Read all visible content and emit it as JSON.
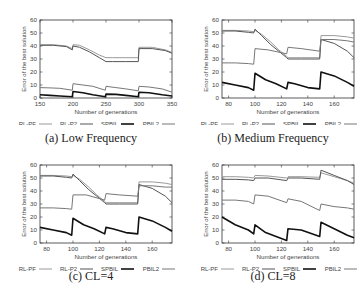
{
  "chart_data": [
    {
      "id": "a",
      "type": "line",
      "caption": "(a) Low Frequency",
      "xlabel": "Number of generations",
      "ylabel": "Error of the best solution",
      "xlim": [
        150,
        350
      ],
      "ylim": [
        0,
        60
      ],
      "xticks": [
        150,
        200,
        250,
        300,
        350
      ],
      "yticks": [
        0,
        10,
        20,
        30,
        40,
        50,
        60
      ],
      "grid": false,
      "legend_position": "bottom",
      "series": [
        {
          "name": "RL-PF",
          "color": "#9a9a9a",
          "width": 1,
          "x": [
            150,
            170,
            190,
            199,
            200,
            210,
            225,
            240,
            250,
            260,
            280,
            299,
            300,
            320,
            340,
            350
          ],
          "y": [
            41,
            41,
            40,
            38,
            41,
            40.5,
            37,
            33,
            31,
            31,
            31,
            31,
            39,
            39,
            37,
            35
          ]
        },
        {
          "name": "RL-P2",
          "color": "#555555",
          "width": 1,
          "x": [
            150,
            170,
            190,
            199,
            200,
            210,
            225,
            240,
            250,
            260,
            280,
            299,
            300,
            320,
            340,
            350
          ],
          "y": [
            40.5,
            40.5,
            39.5,
            37,
            40,
            39,
            35.5,
            31,
            28,
            28,
            28,
            28,
            38,
            38,
            36.5,
            34.5
          ]
        },
        {
          "name": "SPBIL",
          "color": "#111111",
          "width": 1.6,
          "x": [
            150,
            165,
            180,
            199,
            200,
            215,
            230,
            249,
            250,
            265,
            280,
            299,
            300,
            315,
            335,
            350
          ],
          "y": [
            2.5,
            2,
            1.5,
            1,
            5,
            4,
            2.5,
            1,
            3,
            2.8,
            2,
            1,
            4.5,
            4,
            2.5,
            1.5
          ]
        },
        {
          "name": "PBIL2",
          "color": "#777777",
          "width": 1,
          "x": [
            150,
            165,
            180,
            199,
            200,
            215,
            230,
            249,
            250,
            265,
            280,
            299,
            300,
            315,
            335,
            350
          ],
          "y": [
            8,
            7.8,
            7.5,
            6,
            11,
            10,
            9,
            6,
            9,
            8,
            7,
            5.5,
            9,
            8.5,
            7,
            4.5
          ]
        }
      ]
    },
    {
      "id": "b",
      "type": "line",
      "caption": "(b) Medium Frequency",
      "xlabel": "Number of generations",
      "ylabel": "Error of the best solution",
      "xlim": [
        75,
        175
      ],
      "ylim": [
        0,
        60
      ],
      "xticks": [
        80,
        100,
        120,
        140,
        160
      ],
      "yticks": [
        0,
        10,
        20,
        30,
        40,
        50,
        60
      ],
      "grid": false,
      "legend_position": "bottom",
      "series": [
        {
          "name": "RL-PF",
          "color": "#9a9a9a",
          "width": 1,
          "x": [
            75,
            85,
            95,
            99,
            100,
            105,
            112,
            118,
            124,
            125,
            135,
            149,
            150,
            160,
            170,
            175
          ],
          "y": [
            52,
            52,
            51.5,
            51,
            52,
            49,
            43,
            37,
            32,
            31,
            31,
            31,
            48,
            48,
            47,
            46
          ]
        },
        {
          "name": "RL-P2",
          "color": "#555555",
          "width": 1,
          "x": [
            75,
            85,
            95,
            99,
            100,
            105,
            112,
            118,
            124,
            125,
            135,
            149,
            150,
            160,
            170,
            175
          ],
          "y": [
            51.5,
            51.5,
            50.5,
            50,
            53,
            48,
            41,
            36,
            31,
            30,
            30,
            30,
            45,
            42,
            36,
            31
          ]
        },
        {
          "name": "SPBIL",
          "color": "#111111",
          "width": 1.6,
          "x": [
            75,
            85,
            95,
            99,
            100,
            108,
            116,
            124,
            125,
            130,
            140,
            149,
            150,
            160,
            170,
            175
          ],
          "y": [
            12,
            10,
            8,
            6,
            19,
            14,
            11,
            7,
            12,
            11,
            8,
            7,
            20,
            17,
            12,
            9
          ]
        },
        {
          "name": "PBIL2",
          "color": "#777777",
          "width": 1,
          "x": [
            75,
            85,
            95,
            99,
            100,
            110,
            124,
            125,
            135,
            149,
            150,
            160,
            170,
            175
          ],
          "y": [
            27,
            27,
            26.5,
            26,
            38,
            37,
            34,
            39,
            38,
            36,
            45,
            45,
            44,
            43
          ]
        }
      ]
    },
    {
      "id": "c",
      "type": "line",
      "caption": "(c) CL=4",
      "xlabel": "Number of generations",
      "ylabel": "Error of the best solution",
      "xlim": [
        75,
        175
      ],
      "ylim": [
        0,
        60
      ],
      "xticks": [
        80,
        100,
        120,
        140,
        160
      ],
      "yticks": [
        0,
        10,
        20,
        30,
        40,
        50,
        60
      ],
      "grid": false,
      "legend_position": "bottom",
      "series": [
        {
          "name": "RL-PF",
          "color": "#9a9a9a",
          "width": 1,
          "x": [
            75,
            85,
            95,
            99,
            100,
            105,
            112,
            118,
            124,
            125,
            135,
            149,
            150,
            160,
            170,
            175
          ],
          "y": [
            52,
            52,
            51.5,
            51,
            52,
            49,
            43,
            37,
            32,
            31,
            31,
            31,
            47,
            47,
            46,
            45
          ]
        },
        {
          "name": "RL-P2",
          "color": "#555555",
          "width": 1,
          "x": [
            75,
            85,
            95,
            99,
            100,
            105,
            112,
            118,
            124,
            125,
            135,
            149,
            150,
            160,
            170,
            175
          ],
          "y": [
            51.5,
            51.5,
            50.5,
            50,
            53,
            48,
            41,
            36,
            31,
            30,
            30,
            30,
            45,
            42,
            36,
            31
          ]
        },
        {
          "name": "SPBIL",
          "color": "#111111",
          "width": 1.6,
          "x": [
            75,
            85,
            95,
            99,
            100,
            108,
            116,
            124,
            125,
            130,
            140,
            149,
            150,
            160,
            170,
            175
          ],
          "y": [
            12,
            10,
            8,
            6,
            19,
            14,
            11,
            7,
            12,
            11,
            8,
            7,
            20,
            17,
            12,
            9
          ]
        },
        {
          "name": "PBIL2",
          "color": "#777777",
          "width": 1,
          "x": [
            75,
            85,
            95,
            99,
            100,
            110,
            124,
            125,
            135,
            149,
            150,
            160,
            170,
            175
          ],
          "y": [
            27,
            27,
            26.5,
            26,
            37,
            37,
            33,
            38,
            37,
            36,
            44,
            44,
            43,
            43
          ]
        }
      ]
    },
    {
      "id": "d",
      "type": "line",
      "caption": "(d) CL=8",
      "xlabel": "Number of generations",
      "ylabel": "Error of the best solution",
      "xlim": [
        75,
        175
      ],
      "ylim": [
        0,
        60
      ],
      "xticks": [
        80,
        100,
        120,
        140,
        160
      ],
      "yticks": [
        0,
        10,
        20,
        30,
        40,
        50,
        60
      ],
      "grid": false,
      "legend_position": "bottom",
      "series": [
        {
          "name": "RL-PF",
          "color": "#9a9a9a",
          "width": 1,
          "x": [
            75,
            85,
            95,
            99,
            100,
            110,
            124,
            125,
            135,
            149,
            150,
            160,
            170,
            175
          ],
          "y": [
            51,
            51,
            50.5,
            50,
            52,
            51.5,
            50,
            51,
            51,
            50.5,
            54,
            51,
            48,
            46
          ]
        },
        {
          "name": "RL-P2",
          "color": "#555555",
          "width": 1,
          "x": [
            75,
            85,
            95,
            99,
            100,
            110,
            124,
            125,
            135,
            149,
            150,
            160,
            170,
            175
          ],
          "y": [
            49,
            49,
            48.5,
            48,
            50,
            50,
            48,
            50,
            50,
            49,
            56,
            52,
            48,
            45
          ]
        },
        {
          "name": "SPBIL",
          "color": "#111111",
          "width": 1.6,
          "x": [
            75,
            85,
            95,
            99,
            100,
            108,
            116,
            124,
            125,
            135,
            149,
            150,
            160,
            170,
            175
          ],
          "y": [
            20,
            14,
            10,
            7,
            14,
            8,
            5,
            2,
            11,
            10,
            5,
            16,
            11,
            6,
            4
          ]
        },
        {
          "name": "PBIL2",
          "color": "#777777",
          "width": 1,
          "x": [
            75,
            85,
            95,
            99,
            100,
            110,
            124,
            125,
            135,
            149,
            150,
            160,
            170,
            175
          ],
          "y": [
            33,
            33,
            32,
            30,
            37,
            36,
            31,
            34,
            32,
            25,
            30,
            28,
            27,
            26
          ]
        }
      ]
    }
  ],
  "legend": [
    {
      "name": "RL-PF"
    },
    {
      "name": "RL-P2"
    },
    {
      "name": "SPBIL"
    },
    {
      "name": "PBIL2"
    }
  ],
  "panels": [
    {
      "caption": "(a) Low Frequency"
    },
    {
      "caption": "(b) Medium Frequency"
    },
    {
      "caption": "(c) CL=4"
    },
    {
      "caption": "(d) CL=8"
    }
  ]
}
